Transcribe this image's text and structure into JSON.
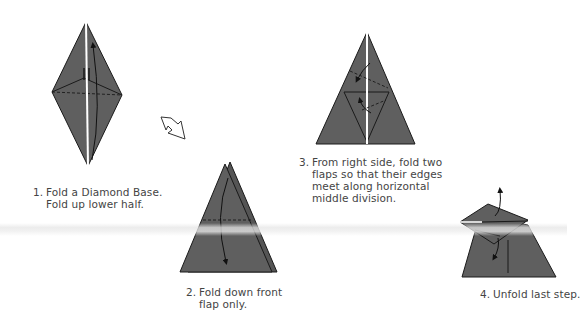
{
  "colors": {
    "paper": "#5f5f5f",
    "paper_dark": "#555555",
    "line": "#1a1a1a",
    "highlight": "#ffffff",
    "background": "#ffffff",
    "text": "#444444"
  },
  "steps": [
    {
      "number": "1.",
      "lines": [
        "Fold a Diamond Base.",
        "Fold up lower half."
      ],
      "diagram": "diamond-base"
    },
    {
      "number": "2.",
      "lines": [
        "Fold down front",
        "flap only."
      ],
      "diagram": "triangle-fold-down"
    },
    {
      "number": "3.",
      "lines": [
        "From right side, fold two",
        "flaps so that their edges",
        "meet along horizontal",
        "middle division."
      ],
      "diagram": "triangle-two-flaps"
    },
    {
      "number": "4.",
      "lines": [
        "Unfold last step."
      ],
      "diagram": "unfold-shape"
    }
  ],
  "icons": {
    "turn_over": "hollow-arrow-icon"
  }
}
